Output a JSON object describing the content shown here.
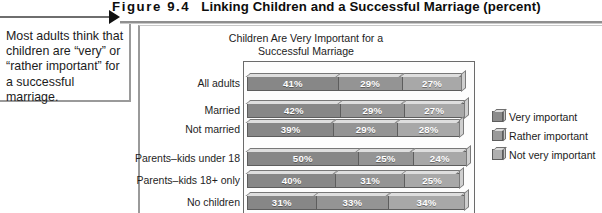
{
  "figure": {
    "number": "Figure  9.4",
    "title": "Linking Children and a Successful Marriage (percent)"
  },
  "caption": {
    "text": "Most adults think that children are “very” or “rather important” for a successful marriage."
  },
  "chart_data": {
    "type": "bar",
    "orientation": "horizontal",
    "stacked": false,
    "title": "Children Are Very Important for a\nSuccessful Marriage",
    "subtitle_line1": "Children Are Very Important for a",
    "subtitle_line2": "Successful Marriage",
    "xlabel": "",
    "ylabel": "",
    "xlim": [
      0,
      100
    ],
    "grid": false,
    "legend_position": "right",
    "categories": [
      "All adults",
      "Married",
      "Not married",
      "Parents–kids under 18",
      "Parents–kids 18+ only",
      "No children"
    ],
    "series": [
      {
        "name": "Very important",
        "color": "#878787",
        "values": [
          41,
          42,
          39,
          50,
          40,
          31
        ],
        "labels": [
          "41%",
          "42%",
          "39%",
          "50%",
          "40%",
          "31%"
        ]
      },
      {
        "name": "Rather important",
        "color": "#949494",
        "values": [
          29,
          29,
          29,
          25,
          31,
          33
        ],
        "labels": [
          "29%",
          "29%",
          "29%",
          "25%",
          "31%",
          "33%"
        ]
      },
      {
        "name": "Not very important",
        "color": "#a8a8a8",
        "values": [
          27,
          27,
          28,
          24,
          25,
          34
        ],
        "labels": [
          "27%",
          "27%",
          "28%",
          "24%",
          "25%",
          "34%"
        ]
      }
    ]
  },
  "legend": {
    "items": [
      {
        "label": "Very important",
        "color": "#8b8b8b"
      },
      {
        "label": "Rather important",
        "color": "#9a9a9a"
      },
      {
        "label": "Not very important",
        "color": "#b0b0b0"
      }
    ]
  },
  "colors": {
    "rule": "#8f8f8f",
    "frame": "#6b6b6b",
    "text": "#1c1c1c"
  }
}
